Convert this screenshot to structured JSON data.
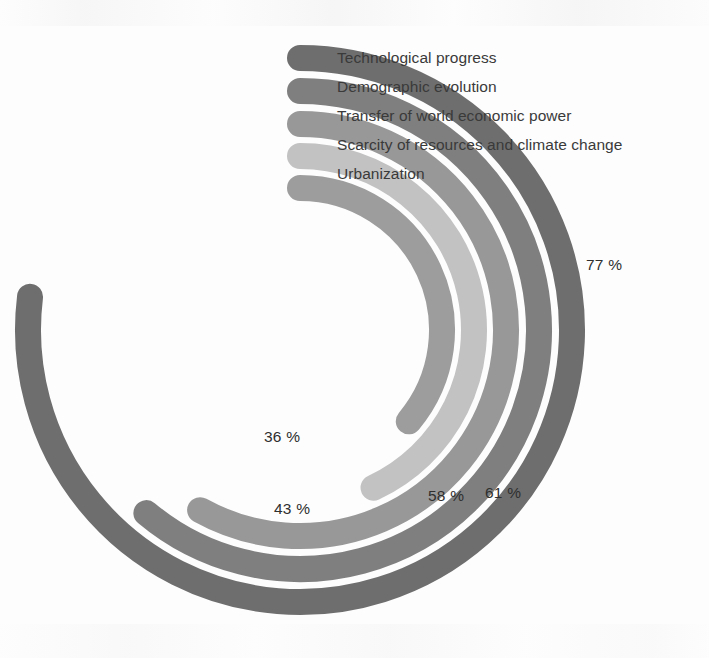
{
  "chart_data": {
    "type": "bar",
    "title": "",
    "subtitle": "",
    "xlabel": "",
    "ylabel": "",
    "layout": "radial concentric arcs, clockwise from 12 o'clock, rounded caps",
    "grid": false,
    "legend_position": "top-right, inline with arc ends",
    "value_unit": "%",
    "value_range": [
      0,
      100
    ],
    "categories": [
      "Technological progress",
      "Demographic evolution",
      "Transfer of world economic power",
      "Scarcity of resources and climate change",
      "Urbanization"
    ],
    "values": [
      77,
      61,
      58,
      43,
      36
    ],
    "value_labels": [
      "77 %",
      "61 %",
      "58 %",
      "43 %",
      "36 %"
    ],
    "colors": [
      "#6e6e6e",
      "#7f7f7f",
      "#989898",
      "#c2c2c2",
      "#9d9d9d"
    ],
    "series": [
      {
        "name": "Technological progress",
        "value": 77,
        "label": "77 %",
        "color": "#6e6e6e",
        "ring": 1,
        "radius": 272,
        "sweep_deg": 277
      },
      {
        "name": "Demographic evolution",
        "value": 61,
        "label": "61 %",
        "color": "#7f7f7f",
        "ring": 2,
        "radius": 239,
        "sweep_deg": 220
      },
      {
        "name": "Transfer of world economic power",
        "value": 58,
        "label": "58 %",
        "color": "#989898",
        "ring": 3,
        "radius": 206,
        "sweep_deg": 209
      },
      {
        "name": "Scarcity of resources and climate change",
        "value": 43,
        "label": "43 %",
        "color": "#c2c2c2",
        "ring": 4,
        "radius": 174,
        "sweep_deg": 155
      },
      {
        "name": "Urbanization",
        "value": 36,
        "label": "36 %",
        "color": "#9d9d9d",
        "ring": 5,
        "radius": 142,
        "sweep_deg": 130
      }
    ]
  },
  "legend": {
    "items": [
      {
        "label": "Technological progress"
      },
      {
        "label": "Demographic evolution"
      },
      {
        "label": "Transfer of world economic power"
      },
      {
        "label": "Scarcity of resources and climate change"
      },
      {
        "label": "Urbanization"
      }
    ]
  },
  "value_labels": {
    "technological_progress": "77 %",
    "demographic_evolution": "61 %",
    "transfer_of_world_economic_power": "58 %",
    "scarcity_of_resources": "43 %",
    "urbanization": "36 %"
  }
}
